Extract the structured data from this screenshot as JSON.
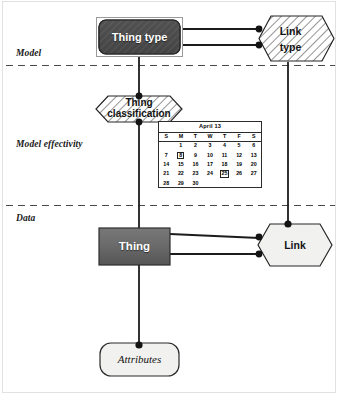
{
  "diagram": {
    "bands": [
      {
        "id": "model",
        "label": "Model"
      },
      {
        "id": "model-effectivity",
        "label": "Model effectivity"
      },
      {
        "id": "data",
        "label": "Data"
      }
    ],
    "nodes": [
      {
        "id": "thing-type",
        "label": "Thing type",
        "shape": "rounded-rect",
        "fill": "#4d4d4d",
        "hatched": true,
        "band": "model"
      },
      {
        "id": "link-type",
        "label_lines": [
          "Link",
          "type"
        ],
        "shape": "hexagon",
        "fill": "#ffffff",
        "hatched": true,
        "band": "model"
      },
      {
        "id": "thing-classification",
        "label_lines": [
          "Thing",
          "classification"
        ],
        "shape": "hexagon",
        "fill": "#ffffff",
        "hatched": true,
        "band": "model-effectivity"
      },
      {
        "id": "thing",
        "label": "Thing",
        "shape": "rect",
        "fill": "#6e6e6e",
        "hatched": false,
        "band": "data"
      },
      {
        "id": "link",
        "label": "Link",
        "shape": "hexagon",
        "fill": "#f0f0ee",
        "hatched": false,
        "band": "data"
      },
      {
        "id": "attributes",
        "label": "Attributes",
        "shape": "rounded-rect",
        "fill": "#f0f0ee",
        "hatched": false,
        "band": "data"
      }
    ],
    "edges": [
      {
        "from": "thing-type",
        "to": "link-type",
        "style": "solid",
        "endpoint": "filled-dot"
      },
      {
        "from": "thing-type",
        "to": "link-type",
        "style": "solid",
        "endpoint": "filled-dot"
      },
      {
        "from": "thing-type",
        "to": "thing-classification",
        "style": "solid",
        "endpoint": "filled-dot"
      },
      {
        "from": "thing-classification",
        "to": "thing",
        "style": "solid",
        "endpoint": "filled-dot"
      },
      {
        "from": "link-type",
        "to": "link",
        "style": "solid",
        "endpoint": "filled-dot"
      },
      {
        "from": "thing",
        "to": "link",
        "style": "solid",
        "endpoint": "filled-dot"
      },
      {
        "from": "thing",
        "to": "link",
        "style": "solid",
        "endpoint": "filled-dot"
      },
      {
        "from": "thing",
        "to": "attributes",
        "style": "solid",
        "endpoint": "filled-dot"
      }
    ],
    "dividers": [
      {
        "id": "model-divider",
        "style": "dashed"
      },
      {
        "id": "data-divider",
        "style": "dashed"
      }
    ],
    "colors": {
      "thing_type_fill": "#4d4d4d",
      "thing_fill": "#6e6e6e",
      "link_fill": "#f0f0ee",
      "attributes_fill": "#f0f0ee",
      "line": "#1a1a1a",
      "divider": "#5a5a5a",
      "frame": "#e2e2e2"
    }
  },
  "calendar": {
    "title": "April 13",
    "weekday_headers": [
      "S",
      "M",
      "T",
      "W",
      "T",
      "F",
      "S"
    ],
    "weeks": [
      [
        "",
        "1",
        "2",
        "3",
        "4",
        "5",
        "6"
      ],
      [
        "7",
        "8",
        "9",
        "10",
        "11",
        "12",
        "13"
      ],
      [
        "14",
        "15",
        "16",
        "17",
        "18",
        "19",
        "20"
      ],
      [
        "21",
        "22",
        "23",
        "24",
        "25",
        "26",
        "27"
      ],
      [
        "28",
        "29",
        "30",
        "",
        "",
        "",
        ""
      ]
    ],
    "selected_dates": [
      "8",
      "25"
    ]
  }
}
